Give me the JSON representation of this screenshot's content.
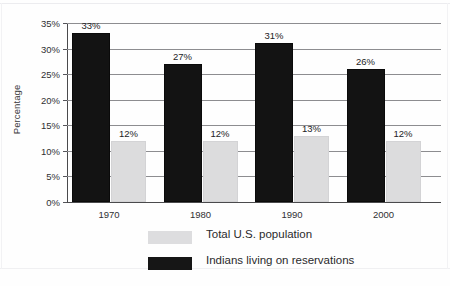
{
  "chart_data": {
    "type": "bar",
    "title": "",
    "xlabel": "",
    "ylabel": "Percentage",
    "categories": [
      "1970",
      "1980",
      "1990",
      "2000"
    ],
    "series": [
      {
        "name": "Total U.S. population",
        "color": "#dcdcdd",
        "values": [
          12,
          12,
          13,
          12
        ],
        "labels": [
          "12%",
          "12%",
          "13%",
          "12%"
        ]
      },
      {
        "name": "Indians living on reservations",
        "color": "#131313",
        "values": [
          33,
          27,
          31,
          26
        ],
        "labels": [
          "33%",
          "27%",
          "31%",
          "26%"
        ]
      }
    ],
    "ylim": [
      0,
      35
    ],
    "yticks": [
      0,
      5,
      10,
      15,
      20,
      25,
      30,
      35
    ],
    "ytick_labels": [
      "0%",
      "5%",
      "10%",
      "15%",
      "20%",
      "25%",
      "30%",
      "35%"
    ],
    "grid": true,
    "legend_position": "bottom"
  },
  "axis": {
    "y_title": "Percentage"
  },
  "legend": {
    "entries": [
      {
        "label": "Total U.S. population",
        "swatch": "light"
      },
      {
        "label": "Indians living on reservations",
        "swatch": "dark"
      }
    ]
  }
}
